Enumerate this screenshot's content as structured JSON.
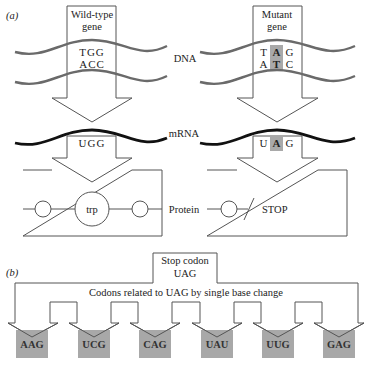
{
  "figure": {
    "part_a": {
      "label": "(a)",
      "row_labels": {
        "dna": "DNA",
        "mrna": "mRNA",
        "protein": "Protein"
      },
      "wild_type": {
        "gene_label_line1": "Wild-type",
        "gene_label_line2": "gene",
        "dna_top": "TGG",
        "dna_bottom": "ACC",
        "mrna": "UGG",
        "amino_acid": "trp"
      },
      "mutant": {
        "gene_label_line1": "Mutant",
        "gene_label_line2": "gene",
        "dna_top": [
          "T",
          "A",
          "G"
        ],
        "dna_bottom": [
          "A",
          "T",
          "C"
        ],
        "mrna": [
          "U",
          "A",
          "G"
        ],
        "highlighted_position": 2,
        "protein_result": "STOP"
      }
    },
    "part_b": {
      "label": "(b)",
      "stop_codon_line1": "Stop codon",
      "stop_codon_line2": "UAG",
      "bracket_label": "Codons related to UAG by single base change",
      "codons": [
        {
          "text": "AAG",
          "changed_index": 0
        },
        {
          "text": "UCG",
          "changed_index": 1
        },
        {
          "text": "CAG",
          "changed_index": 0
        },
        {
          "text": "UAU",
          "changed_index": 2
        },
        {
          "text": "UUG",
          "changed_index": 1
        },
        {
          "text": "GAG",
          "changed_index": 0
        }
      ]
    },
    "colors": {
      "dna_strand": "#6a6a6a",
      "mrna_strand": "#111111",
      "highlight": "#a9a9a9",
      "codon_box": "#a8a8a8"
    }
  }
}
